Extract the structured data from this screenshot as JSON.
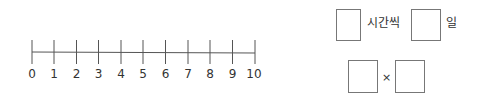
{
  "number_line": {
    "start": 0,
    "end": 10,
    "step": 1,
    "tick_labels": [
      "0",
      "1",
      "2",
      "3",
      "4",
      "5",
      "6",
      "7",
      "8",
      "9",
      "10"
    ],
    "line_color": "#555555"
  },
  "expression_1": {
    "box_1_value": "",
    "unit_1": "시간씩",
    "box_2_value": "",
    "unit_2": "일"
  },
  "expression_2": {
    "box_1_value": "",
    "operator": "×",
    "box_2_value": ""
  }
}
